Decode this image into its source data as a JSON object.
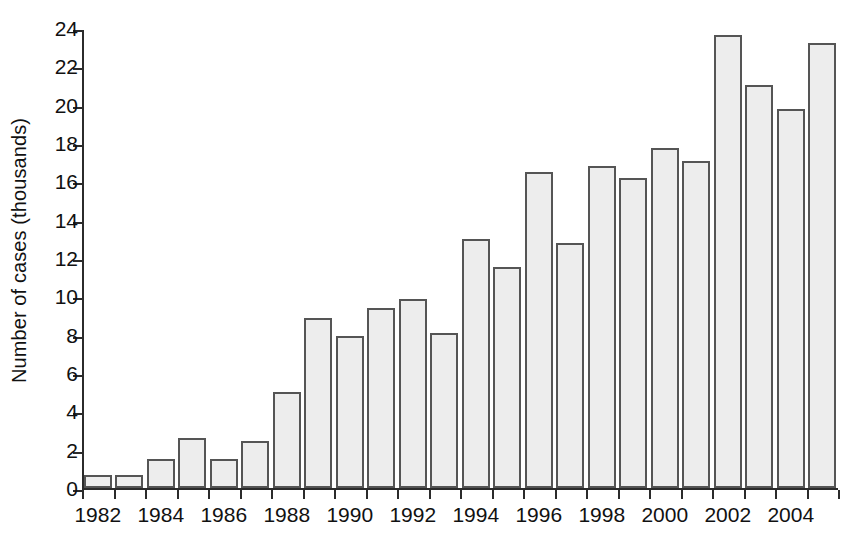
{
  "chart_data": {
    "type": "bar",
    "title": "",
    "subtitle": "",
    "xlabel": "",
    "ylabel": "Number of cases (thousands)",
    "ylim": [
      0,
      24
    ],
    "y_ticks": [
      0,
      2,
      4,
      6,
      8,
      10,
      12,
      14,
      16,
      18,
      20,
      22,
      24
    ],
    "y_tick_labels": [
      "0",
      "2",
      "4",
      "6",
      "8",
      "10",
      "12",
      "14",
      "16",
      "18",
      "20",
      "22",
      "24"
    ],
    "grid": false,
    "legend": null,
    "legend_position": "none",
    "categories": [
      "1982",
      "1983",
      "1984",
      "1985",
      "1986",
      "1987",
      "1988",
      "1989",
      "1990",
      "1991",
      "1992",
      "1993",
      "1994",
      "1995",
      "1996",
      "1997",
      "1998",
      "1999",
      "2000",
      "2001",
      "2002",
      "2003",
      "2004",
      "2005"
    ],
    "x_tick_labels_shown": [
      "1982",
      "1984",
      "1986",
      "1988",
      "1990",
      "1992",
      "1994",
      "1996",
      "1998",
      "2000",
      "2002",
      "2004"
    ],
    "values": [
      0.7,
      0.7,
      1.5,
      2.6,
      1.5,
      2.45,
      5.0,
      8.85,
      7.95,
      9.4,
      9.85,
      8.1,
      13.0,
      11.55,
      16.5,
      12.8,
      16.8,
      16.2,
      17.75,
      17.05,
      23.65,
      21.05,
      19.8,
      23.2
    ],
    "bar_fill_color": "#ededed",
    "bar_border_color": "#555555",
    "axis_color": "#2b2b2b",
    "background_color": "#ffffff"
  }
}
